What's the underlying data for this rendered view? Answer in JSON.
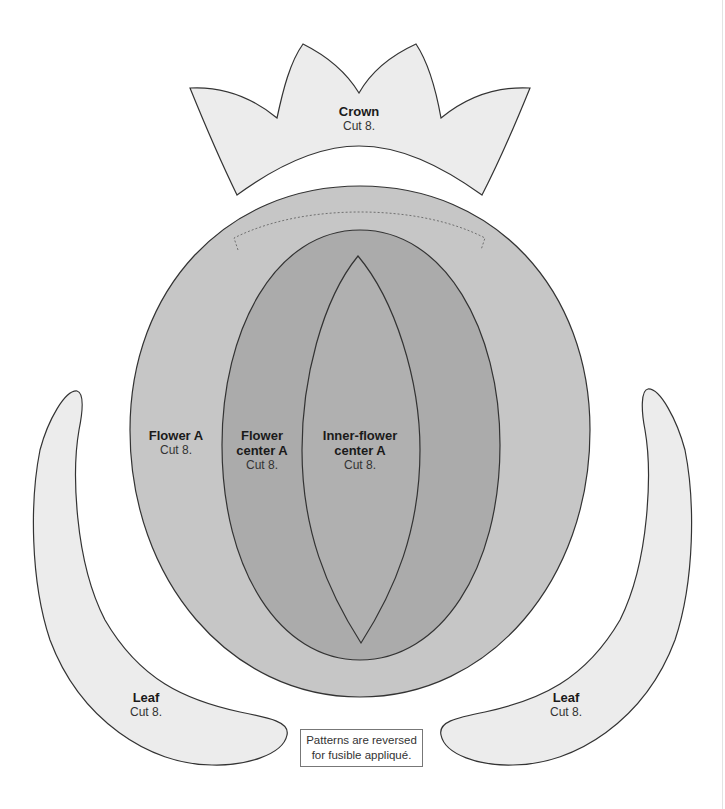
{
  "pieces": {
    "crown": {
      "title": "Crown",
      "cut": "Cut 8."
    },
    "flower": {
      "title": "Flower A",
      "cut": "Cut 8."
    },
    "flower_center": {
      "title1": "Flower",
      "title2": "center A",
      "cut": "Cut 8."
    },
    "inner_flower_center": {
      "title1": "Inner-flower",
      "title2": "center A",
      "cut": "Cut 8."
    },
    "leaf_left": {
      "title": "Leaf",
      "cut": "Cut 8."
    },
    "leaf_right": {
      "title": "Leaf",
      "cut": "Cut 8."
    }
  },
  "note": {
    "line1": "Patterns are reversed",
    "line2": "for fusible appliqué."
  },
  "colors": {
    "light_fill": "#ececec",
    "flower_fill": "#c6c6c6",
    "center_fill": "#ababab",
    "inner_fill": "#b2b2b2",
    "stroke": "#333333"
  }
}
